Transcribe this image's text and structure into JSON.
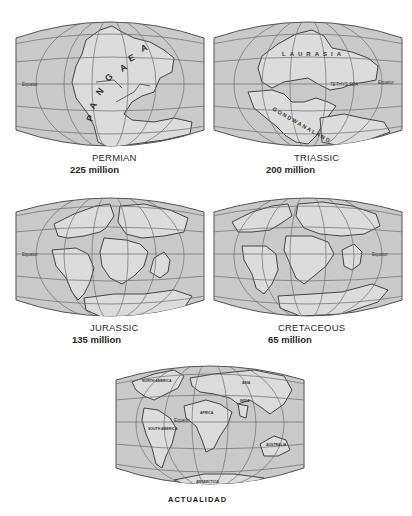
{
  "figure": {
    "type": "continental-drift-sequence",
    "colors": {
      "ocean": "#c9c9c9",
      "land": "#dcdcdc",
      "outline": "#4a4a4a",
      "grid": "#6e6e6e",
      "background": "#ffffff"
    },
    "panels": [
      {
        "id": "permian",
        "period": "PERMIAN",
        "age": "225 million",
        "map_labels": [
          "P",
          "A",
          "N",
          "G",
          "A",
          "E",
          "A"
        ],
        "supercontinent": "PANGAEA",
        "equator_label": "Equator"
      },
      {
        "id": "triassic",
        "period": "TRIASSIC",
        "age": "200 million",
        "map_labels": {
          "north": "LAURASIA",
          "south": "GONDWANALAND",
          "sea": "TETHYS SEA"
        },
        "equator_label": "Equator"
      },
      {
        "id": "jurassic",
        "period": "JURASSIC",
        "age": "135 million",
        "equator_label": "Equator"
      },
      {
        "id": "cretaceous",
        "period": "CRETACEOUS",
        "age": "65 million",
        "equator_label": "Equator"
      },
      {
        "id": "actualidad",
        "period": "ACTUALIDAD",
        "map_labels": {
          "north_america": "NORTH AMERICA",
          "south_america": "SOUTH AMERICA",
          "africa": "AFRICA",
          "asia": "ASIA",
          "india": "INDIA",
          "australia": "AUSTRALIA",
          "antarctica": "ANTARCTICA"
        },
        "equator_label": "Equator"
      }
    ]
  }
}
